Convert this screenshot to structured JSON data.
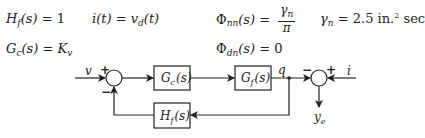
{
  "equations": {
    "hf": {
      "lhs": "H",
      "sub": "f",
      "arg": "(s)",
      "eq": " = ",
      "rhs": "1"
    },
    "it": {
      "lhs": "i(t)",
      "eq": " = ",
      "rhs": "v",
      "rhs_sub": "d",
      "rhs_arg": "(t)"
    },
    "phinn": {
      "lhs": "Φ",
      "sub": "nn",
      "arg": "(s)",
      "eq": " = ",
      "num": "γ",
      "num_sub": "n",
      "den": "π"
    },
    "gamma": {
      "lhs": "γ",
      "sub": "n",
      "eq": " = ",
      "value": "2.5 in.",
      "sup": "2",
      "unit": " sec"
    },
    "gc": {
      "lhs": "G",
      "sub": "c",
      "arg": "(s)",
      "eq": " = ",
      "rhs": "K",
      "rhs_sub": "v"
    },
    "phidn": {
      "lhs": "Φ",
      "sub": "dn",
      "arg": "(s)",
      "eq": " = ",
      "rhs": "0"
    }
  },
  "diagram": {
    "input_v": "v",
    "input_i": "i",
    "signal_q": "q",
    "output": "y",
    "output_sub": "e",
    "blocks": {
      "gc": {
        "name": "G",
        "sub": "c",
        "arg": "(s)"
      },
      "gf": {
        "name": "G",
        "sub": "f",
        "arg": "(s)"
      },
      "hf": {
        "name": "H",
        "sub": "f",
        "arg": "(s)"
      }
    },
    "sum1_signs": {
      "top": "+",
      "bottom": "−"
    },
    "sum2_signs": {
      "left": "−",
      "right": "+"
    }
  }
}
